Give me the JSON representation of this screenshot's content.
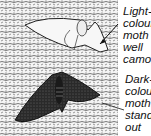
{
  "figure": {
    "labels": [
      {
        "id": "light",
        "lines": [
          "Light-",
          "colour",
          "moth i",
          "well",
          "camou"
        ]
      },
      {
        "id": "dark",
        "lines": [
          "Dark-",
          "colour",
          "moth",
          "stands",
          "out"
        ]
      }
    ],
    "colors": {
      "background": "#ffffff",
      "ink": "#111111",
      "bark_shade": "#6a6a6a",
      "dark_moth": "#1e1e1e"
    }
  }
}
